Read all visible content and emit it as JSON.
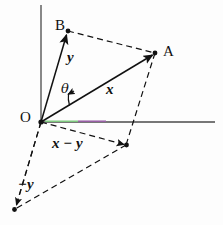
{
  "figure": {
    "background_color": "#fdfdfd",
    "ink_color": "#111111",
    "axis_color": "#4a4a4a",
    "accent_green": "#7ec87e",
    "accent_purple": "#9a5fa8",
    "width": 223,
    "height": 225
  },
  "labels": {
    "point_a": "A",
    "point_b": "B",
    "origin": "O",
    "vector_x": "x",
    "vector_y": "y",
    "angle_theta": "θ",
    "vector_x_minus_y": "x − y",
    "vector_minus_y": "−y"
  },
  "geometry": {
    "origin": {
      "x": 41,
      "y": 122
    },
    "point_a": {
      "x": 155,
      "y": 53
    },
    "point_b": {
      "x": 68,
      "y": 31
    },
    "point_x_minus_y": {
      "x": 126,
      "y": 145
    },
    "point_minus_y": {
      "x": 15,
      "y": 209
    },
    "vertical_axis": {
      "x": 41,
      "y_top": 5,
      "y_bottom": 122
    },
    "horizontal_axis": {
      "y": 122,
      "x_left": 41,
      "x_right": 215
    },
    "green_segment": {
      "x_start": 45,
      "x_end": 78
    },
    "purple_segment": {
      "x_start": 78,
      "x_end": 106
    },
    "theta_arc_radius": 30
  }
}
